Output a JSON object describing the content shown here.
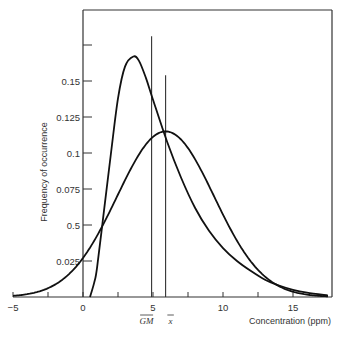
{
  "chart_data": {
    "type": "line",
    "title": "",
    "xlabel": "Concentration (ppm)",
    "ylabel": "Frequency of occurrence",
    "xlim": [
      -5,
      17.5
    ],
    "ylim": [
      0,
      0.2
    ],
    "grid": false,
    "legend": null,
    "x_ticks": [
      {
        "value": -5,
        "label": "−5"
      },
      {
        "value": -2.5,
        "label": ""
      },
      {
        "value": 0,
        "label": "0"
      },
      {
        "value": 2.5,
        "label": ""
      },
      {
        "value": 5,
        "label": "5"
      },
      {
        "value": 7.5,
        "label": ""
      },
      {
        "value": 10,
        "label": "10"
      },
      {
        "value": 12.5,
        "label": ""
      },
      {
        "value": 15,
        "label": "15"
      }
    ],
    "y_ticks": [
      {
        "value": 0.025,
        "label": "0.025"
      },
      {
        "value": 0.05,
        "label": "0.5"
      },
      {
        "value": 0.075,
        "label": "0.075"
      },
      {
        "value": 0.1,
        "label": "0.1"
      },
      {
        "value": 0.125,
        "label": "0.125"
      },
      {
        "value": 0.15,
        "label": "0.15"
      },
      {
        "value": 0.175,
        "label": ""
      }
    ],
    "series": [
      {
        "name": "Lognormal distribution",
        "x": [
          0.5,
          0.8,
          1.0,
          1.5,
          2.0,
          2.5,
          3.0,
          3.6,
          4.0,
          4.5,
          5.0,
          6.0,
          7.0,
          8.0,
          9.0,
          10.0,
          11.0,
          12.0,
          13.0,
          14.0,
          15.0,
          16.0,
          17.5
        ],
        "y": [
          0.0,
          0.01,
          0.02,
          0.06,
          0.1,
          0.138,
          0.16,
          0.167,
          0.164,
          0.152,
          0.137,
          0.108,
          0.083,
          0.062,
          0.046,
          0.034,
          0.025,
          0.018,
          0.012,
          0.008,
          0.005,
          0.003,
          0.001
        ]
      },
      {
        "name": "Normal distribution",
        "mean": 5.9,
        "sd": 3.47,
        "peak": 0.115
      }
    ],
    "annotations": [
      {
        "type": "vline",
        "x": 4.9,
        "y_top": 0.181,
        "label": "GM",
        "label_style": "overline"
      },
      {
        "type": "vline",
        "x": 5.9,
        "y_top": 0.154,
        "label": "x",
        "label_style": "overline"
      }
    ]
  }
}
